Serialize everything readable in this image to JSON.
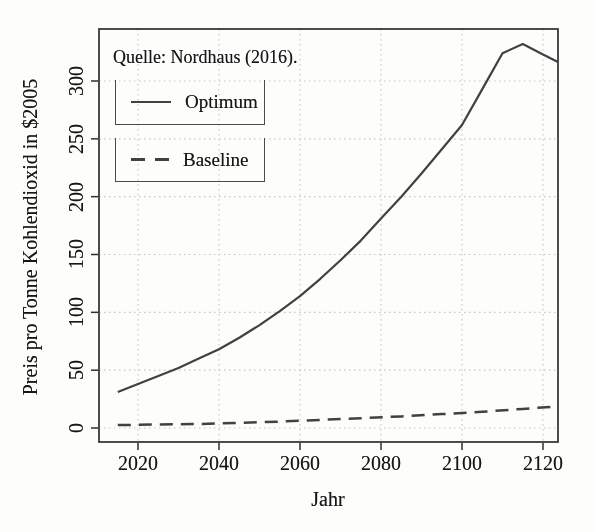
{
  "chart_data": {
    "type": "line",
    "title": "",
    "source_note": "Quelle: Nordhaus (2016).",
    "xlabel": "Jahr",
    "ylabel": "Preis pro Tonne Kohlendioxid in $2005",
    "x_ticks": [
      2020,
      2040,
      2060,
      2080,
      2100,
      2120
    ],
    "y_ticks": [
      0,
      50,
      100,
      150,
      200,
      250,
      300
    ],
    "x_range": [
      2010.5,
      2123.7
    ],
    "y_range": [
      -12,
      345
    ],
    "grid": "dotted",
    "legend_position": "top-left, separate boxed entries",
    "legend": [
      {
        "label": "Optimum",
        "style": "solid"
      },
      {
        "label": "Baseline",
        "style": "dashed"
      }
    ],
    "series": [
      {
        "name": "Optimum",
        "style": "solid",
        "x": [
          2015,
          2020,
          2025,
          2030,
          2035,
          2040,
          2045,
          2050,
          2055,
          2060,
          2065,
          2070,
          2075,
          2080,
          2085,
          2090,
          2095,
          2100,
          2105,
          2110,
          2115,
          2120,
          2125
        ],
        "y": [
          31,
          38,
          45,
          52,
          60,
          68,
          78,
          89,
          101,
          114,
          129,
          145,
          162,
          181,
          200,
          220,
          241,
          262,
          293,
          324,
          332,
          323,
          314
        ]
      },
      {
        "name": "Baseline",
        "style": "dashed",
        "x": [
          2015,
          2025,
          2035,
          2045,
          2055,
          2065,
          2075,
          2085,
          2095,
          2105,
          2115,
          2125
        ],
        "y": [
          2.5,
          3,
          3.5,
          4.5,
          5.5,
          7,
          8.5,
          10,
          12,
          14,
          16.5,
          19
        ]
      }
    ],
    "colors": {
      "line": "#414141",
      "grid": "#c6c6c4",
      "frame": "#2e2e2e",
      "text": "#171717",
      "background": "#fdfdfc"
    }
  }
}
